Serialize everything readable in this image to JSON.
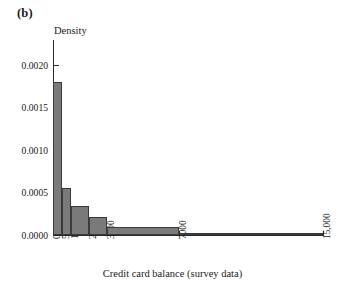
{
  "panel": {
    "label": "(b)"
  },
  "axes": {
    "y_title": "Density",
    "x_title": "Credit card balance (survey data)",
    "y_ticks": [
      "0.0000",
      "0.0005",
      "0.0010",
      "0.0015",
      "0.0020"
    ],
    "x_ticks": [
      "0",
      "500",
      "1000",
      "2000",
      "3000",
      "7000",
      "15,000"
    ]
  },
  "colors": {
    "bar_fill": "#7a7a7a",
    "bar_edge": "#3b3b3b",
    "axis": "#2b2b2b",
    "text": "#1a1a1a",
    "background": "#ffffff"
  },
  "chart_data": {
    "type": "bar",
    "title": "(b)",
    "xlabel": "Credit card balance (survey data)",
    "ylabel": "Density",
    "xlim": [
      0,
      15000
    ],
    "ylim": [
      0,
      0.0023
    ],
    "grid": false,
    "legend": "none",
    "note": "Unequal-width histogram bins; bar height is density (relative frequency divided by bin width).",
    "bin_edges": [
      0,
      500,
      1000,
      2000,
      3000,
      7000,
      15000
    ],
    "bin_labels": [
      "0-500",
      "500-1000",
      "1000-2000",
      "2000-3000",
      "3000-7000",
      "7000-15,000"
    ],
    "values": [
      0.0018,
      0.00055,
      0.00034,
      0.00021,
      9e-05,
      5e-06
    ],
    "y_tick_values": [
      0.0,
      0.0005,
      0.001,
      0.0015,
      0.002
    ],
    "x_tick_values": [
      0,
      500,
      1000,
      2000,
      3000,
      7000,
      15000
    ]
  },
  "bars": [
    {
      "name": "bin-0-500",
      "x0": 0,
      "x1": 500,
      "value": 0.0018
    },
    {
      "name": "bin-500-1000",
      "x0": 500,
      "x1": 1000,
      "value": 0.00055
    },
    {
      "name": "bin-1000-2000",
      "x0": 1000,
      "x1": 2000,
      "value": 0.00034
    },
    {
      "name": "bin-2000-3000",
      "x0": 2000,
      "x1": 3000,
      "value": 0.00021
    },
    {
      "name": "bin-3000-7000",
      "x0": 3000,
      "x1": 7000,
      "value": 9e-05
    },
    {
      "name": "bin-7000-15000",
      "x0": 7000,
      "x1": 15000,
      "value": 5e-06
    }
  ]
}
